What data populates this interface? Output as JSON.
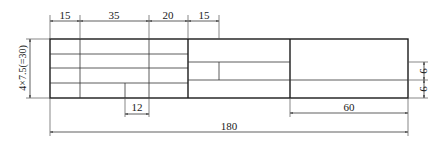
{
  "diagram": {
    "type": "title-block-dimension-drawing",
    "colors": {
      "line": "#1a1a1a",
      "thin_line": "#555555",
      "background": "#ffffff"
    },
    "dimensions": {
      "top": [
        {
          "label": "15",
          "x1": 50,
          "x2": 80
        },
        {
          "label": "35",
          "x1": 80,
          "x2": 149
        },
        {
          "label": "20",
          "x1": 149,
          "x2": 188
        },
        {
          "label": "15",
          "x1": 188,
          "x2": 219
        }
      ],
      "left_vertical": {
        "label": "4×7.5(=30)"
      },
      "bottom_small": {
        "label": "12"
      },
      "right_60": {
        "label": "60"
      },
      "overall": {
        "label": "180"
      },
      "right_rows": [
        {
          "label": "9"
        },
        {
          "label": "9"
        }
      ]
    },
    "sections": {
      "left": {
        "rows": 4,
        "columns_mm": [
          15,
          35,
          20
        ]
      },
      "middle": {
        "width_mm": 15
      },
      "right": {
        "width_mm": 60,
        "rows_mm": [
          9,
          9
        ]
      }
    }
  }
}
